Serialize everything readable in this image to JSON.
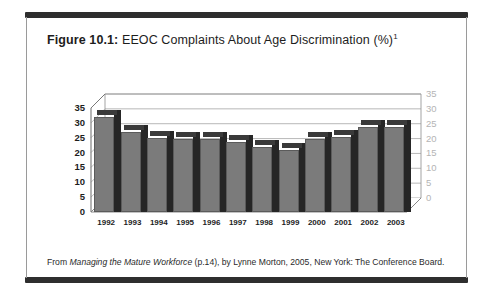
{
  "figure": {
    "label": "Figure 10.1:",
    "caption": "EEOC Complaints About Age Discrimination (%)",
    "caption_superscript": "1",
    "source_prefix": "From ",
    "source_title": "Managing the Mature Workforce",
    "source_rest": " (p.14), by Lynne Morton, 2005, New York:  The Conference Board."
  },
  "colors": {
    "frame_bar": "#2e2e2e",
    "frame_edge": "#9a9a9a",
    "bar_front": "#7b7b7b",
    "bar_side": "#262626",
    "bar_top": "#3a3a3a",
    "gridline": "#b0b0b0",
    "axis_left_text": "#1d1d1d",
    "axis_right_text": "#b4b4b4",
    "plot_background": "#ffffff"
  },
  "chart_data": {
    "type": "bar",
    "title": "EEOC Complaints About Age Discrimination (%)",
    "xlabel": "",
    "ylabel": "",
    "categories": [
      "1992",
      "1993",
      "1994",
      "1995",
      "1996",
      "1997",
      "1998",
      "1999",
      "2000",
      "2001",
      "2002",
      "2003"
    ],
    "values": [
      32,
      27,
      25,
      24.5,
      24.5,
      23.5,
      21.8,
      21,
      24.5,
      25.2,
      28.5,
      28.5
    ],
    "series": [
      {
        "name": "EEOC Complaints About Age Discrimination (%)",
        "values": [
          32,
          27,
          25,
          24.5,
          24.5,
          23.5,
          21.8,
          21,
          24.5,
          25.2,
          28.5,
          28.5
        ]
      }
    ],
    "ylim": [
      0,
      35
    ],
    "yticks": [
      0,
      5,
      10,
      15,
      20,
      25,
      30,
      35
    ],
    "ytick_labels_left": [
      "0",
      "5",
      "10",
      "15",
      "20",
      "25",
      "30",
      "35"
    ],
    "ytick_labels_right": [
      "0",
      "5",
      "10",
      "15",
      "20",
      "25",
      "30",
      "35"
    ],
    "grid": true,
    "legend": false,
    "three_d": true
  }
}
